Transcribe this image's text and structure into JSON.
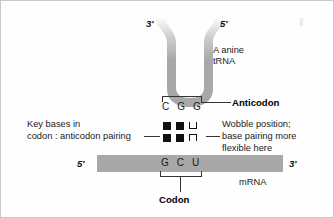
{
  "figure": {
    "background_color": "#fefefe",
    "molecule_color": "#a8a8a8",
    "ink_color": "#1a1a1a"
  },
  "trna": {
    "label_line1": "A anine",
    "label_line2": "tRNA",
    "prime_left": "3′",
    "prime_right": "5′",
    "anticodon_bases": "C G G",
    "anticodon_label": "Anticodon"
  },
  "pairing": {
    "caption_line1": "Key bases in",
    "caption_line2": "codon : anticodon pairing",
    "symbols_top": [
      "filled-square",
      "filled-square",
      "open-u"
    ],
    "symbols_bottom": [
      "filled-square",
      "filled-square",
      "open-n"
    ]
  },
  "wobble": {
    "line1": "Wobble position;",
    "line2": "base pairing more",
    "line3": "flexible here"
  },
  "mrna": {
    "prime_left": "5′",
    "prime_right": "3′",
    "codon_bases": "G C U",
    "strand_label": "mRNA",
    "codon_label": "Codon"
  },
  "artifact": {
    "mark": "‖"
  }
}
